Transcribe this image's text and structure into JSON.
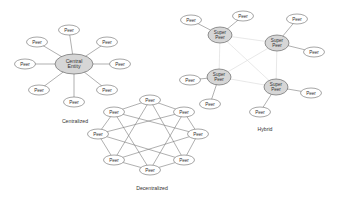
{
  "diagram": {
    "colors": {
      "hub_fill": "#d6d6d6",
      "peer_fill": "#ffffff",
      "stroke": "#6a6a6a",
      "faint_link": "#e2e2e2"
    },
    "centralized": {
      "caption": "Centralized",
      "hub": {
        "label_line1": "Central",
        "label_line2": "Entity",
        "x": 74,
        "y": 64
      },
      "peers": [
        {
          "label": "Peer",
          "x": 69,
          "y": 30
        },
        {
          "label": "Peer",
          "x": 37,
          "y": 42
        },
        {
          "label": "Peer",
          "x": 107,
          "y": 42
        },
        {
          "label": "Peer",
          "x": 25,
          "y": 64
        },
        {
          "label": "Peer",
          "x": 120,
          "y": 64
        },
        {
          "label": "Peer",
          "x": 39,
          "y": 90
        },
        {
          "label": "Peer",
          "x": 107,
          "y": 90
        },
        {
          "label": "Peer",
          "x": 74,
          "y": 102
        }
      ]
    },
    "decentralized": {
      "caption": "Decentralized",
      "peers": [
        {
          "label": "Peer",
          "x": 150,
          "y": 100
        },
        {
          "label": "Peer",
          "x": 184,
          "y": 112
        },
        {
          "label": "Peer",
          "x": 198,
          "y": 134
        },
        {
          "label": "Peer",
          "x": 184,
          "y": 160
        },
        {
          "label": "Peer",
          "x": 150,
          "y": 170
        },
        {
          "label": "Peer",
          "x": 114,
          "y": 160
        },
        {
          "label": "Peer",
          "x": 98,
          "y": 134
        },
        {
          "label": "Peer",
          "x": 114,
          "y": 112
        }
      ]
    },
    "hybrid": {
      "caption": "Hybrid",
      "super_peers": [
        {
          "label_line1": "Super",
          "label_line2": "Peer",
          "x": 220,
          "y": 35,
          "peers": [
            {
              "label": "Peer",
              "x": 191,
              "y": 20
            },
            {
              "label": "Peer",
              "x": 243,
              "y": 16
            }
          ]
        },
        {
          "label_line1": "Super",
          "label_line2": "Peer",
          "x": 277,
          "y": 43,
          "peers": [
            {
              "label": "Peer",
              "x": 297,
              "y": 19
            },
            {
              "label": "Peer",
              "x": 314,
              "y": 52
            }
          ]
        },
        {
          "label_line1": "Super",
          "label_line2": "Peer",
          "x": 219,
          "y": 77,
          "peers": [
            {
              "label": "Peer",
              "x": 190,
              "y": 80
            },
            {
              "label": "Peer",
              "x": 210,
              "y": 104
            }
          ]
        },
        {
          "label_line1": "Super",
          "label_line2": "Peer",
          "x": 276,
          "y": 87,
          "peers": [
            {
              "label": "Peer",
              "x": 311,
              "y": 93
            },
            {
              "label": "Peer",
              "x": 260,
              "y": 112
            }
          ]
        }
      ]
    }
  }
}
